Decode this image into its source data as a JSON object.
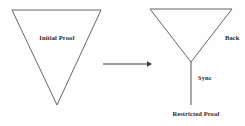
{
  "figure": {
    "background_color": "#fefefe",
    "stroke_color": "#555555",
    "text_color": "#2a2a2a",
    "left_shape": {
      "name": "inverted-triangle",
      "label": "Initial Proof",
      "vertices": [
        [
          12,
          10
        ],
        [
          101,
          10
        ],
        [
          57,
          105
        ]
      ]
    },
    "arrow": {
      "name": "transform-arrow",
      "direction": "right",
      "from": [
        103,
        64
      ],
      "to": [
        150,
        64
      ],
      "label": ""
    },
    "right_shape": {
      "name": "inverted-triangle",
      "vertices": [
        [
          150,
          9
        ],
        [
          232,
          9
        ],
        [
          191,
          62
        ]
      ],
      "stem": {
        "from": [
          191,
          62
        ],
        "to": [
          191,
          105
        ]
      },
      "edge_label": "Back",
      "stem_label": "Sync",
      "bottom_label": "Restricted Proof"
    }
  }
}
